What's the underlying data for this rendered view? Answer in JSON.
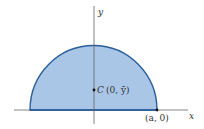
{
  "diagram": {
    "type": "semicircle-centroid",
    "colors": {
      "fill": "#a9c6e6",
      "stroke": "#2a5d9a",
      "axis": "#555555",
      "text": "#333333"
    },
    "labels": {
      "y_axis": "y",
      "x_axis": "x",
      "centroid_letter": "C",
      "centroid_coords": "(0, ȳ)",
      "endpoint": "(a, 0)"
    }
  }
}
